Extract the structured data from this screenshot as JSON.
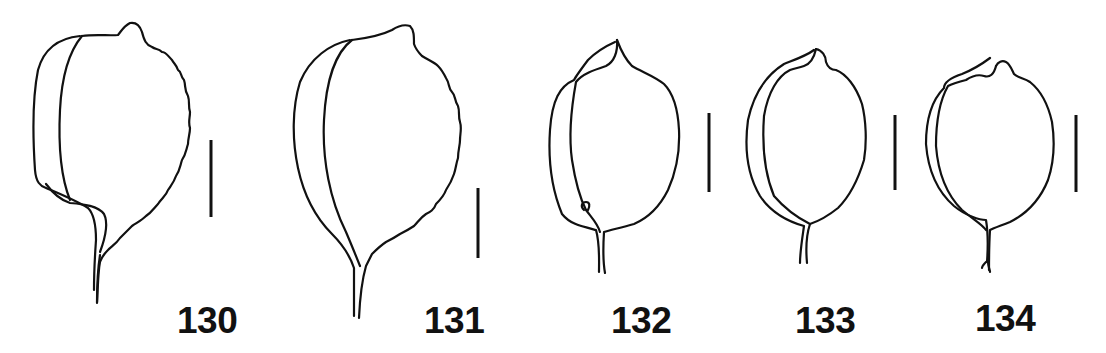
{
  "plate": {
    "background": "#ffffff",
    "ink_color": "#111111",
    "figures": [
      {
        "number": "130",
        "scale_bar": true
      },
      {
        "number": "131",
        "scale_bar": true
      },
      {
        "number": "132",
        "scale_bar": true
      },
      {
        "number": "133",
        "scale_bar": true
      },
      {
        "number": "134",
        "scale_bar": true
      }
    ]
  }
}
